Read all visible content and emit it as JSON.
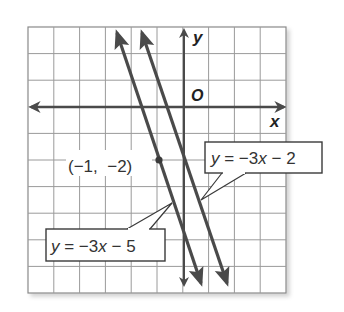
{
  "chart_data": {
    "type": "line",
    "title": "",
    "xlabel": "x",
    "ylabel": "y",
    "origin_label": "O",
    "xlim": [
      -6,
      4
    ],
    "ylim": [
      -7,
      3
    ],
    "grid": true,
    "grid_step": 1,
    "tick_labels_shown": false,
    "series": [
      {
        "name": "y = −3x − 5",
        "slope": -3,
        "intercept": -5,
        "x": [
          -2.66,
          0.59
        ],
        "y": [
          2.97,
          -6.77
        ],
        "arrows": "both"
      },
      {
        "name": "y = −3x − 2",
        "slope": -3,
        "intercept": -2,
        "x": [
          -1.66,
          1.59
        ],
        "y": [
          2.97,
          -6.77
        ],
        "arrows": "both"
      }
    ],
    "points": [
      {
        "x": -1,
        "y": -2,
        "label": "(−1, −2)",
        "on_series": "y = −3x − 5"
      }
    ],
    "annotations": [
      {
        "text": "y = −3x − 2",
        "type": "callout",
        "target": "y = −3x − 2"
      },
      {
        "text": "y = −3x − 5",
        "type": "callout",
        "target": "y = −3x − 5"
      }
    ],
    "legend": "none"
  },
  "labels": {
    "x_axis": "x",
    "y_axis": "y",
    "origin": "O",
    "point": "(−1,  −2)",
    "eq1_y": "y",
    "eq1_mid": " = −3",
    "eq1_x": "x",
    "eq1_end": " − 2",
    "eq2_y": "y",
    "eq2_mid": " = −3",
    "eq2_x": "x",
    "eq2_end": " − 5"
  },
  "colors": {
    "grid": "#9a9a9a",
    "axis": "#4a4a4a",
    "line": "#4a4a4a",
    "text": "#222222",
    "background": "#ffffff"
  }
}
